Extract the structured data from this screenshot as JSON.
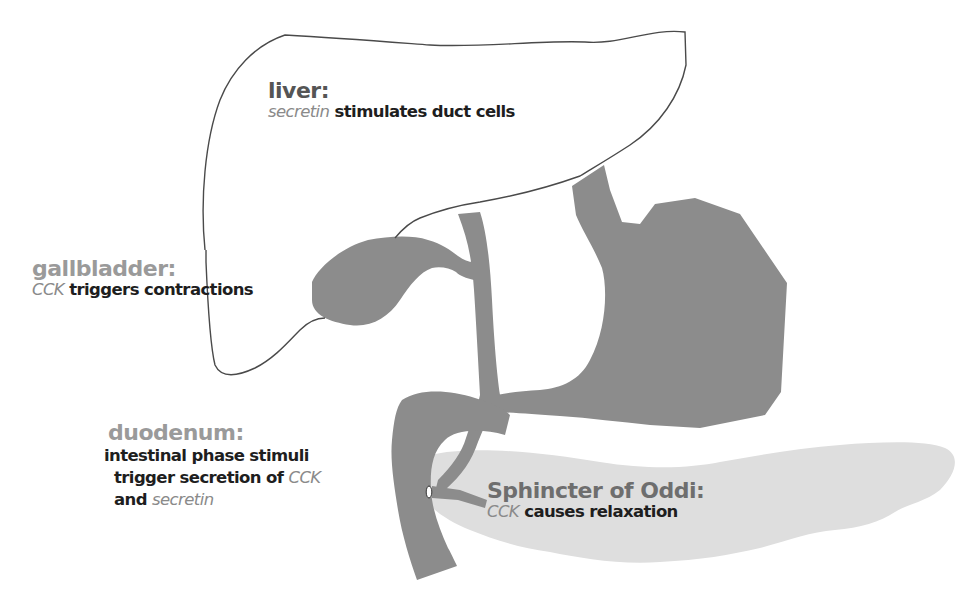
{
  "diagram": {
    "colors": {
      "background": "#ffffff",
      "organ_fill": "#8c8c8c",
      "pancreas_fill": "#dedede",
      "liver_outline": "#4a4a4a",
      "title_text_light": "#9a9a9a",
      "title_text_dark": "#555555",
      "body_text": "#1e1e1e",
      "hormone_text": "#8a8a8a"
    },
    "organs": [
      {
        "id": "liver",
        "style": "outline"
      },
      {
        "id": "gallbladder",
        "style": "filled-dark"
      },
      {
        "id": "common-bile-duct",
        "style": "filled-dark"
      },
      {
        "id": "stomach",
        "style": "filled-dark"
      },
      {
        "id": "duodenum",
        "style": "filled-dark"
      },
      {
        "id": "pancreas",
        "style": "filled-light"
      },
      {
        "id": "pancreatic-duct",
        "style": "filled-dark"
      },
      {
        "id": "sphincter-of-oddi",
        "style": "small-oval-marker"
      }
    ],
    "labels": {
      "liver": {
        "title": "liver:",
        "desc_hormone": "secretin",
        "desc_text": " stimulates duct cells"
      },
      "gallbladder": {
        "title": "gallbladder:",
        "desc_hormone": "CCK",
        "desc_text": " triggers contractions"
      },
      "duodenum": {
        "title": "duodenum:",
        "line1": "intestinal phase stimuli",
        "line2_text": "trigger secretion of ",
        "line2_hormone": "CCK",
        "line3_text": "and ",
        "line3_hormone": "secretin"
      },
      "sphincter": {
        "title": "Sphincter of Oddi:",
        "desc_hormone": "CCK",
        "desc_text": " causes relaxation"
      }
    }
  }
}
